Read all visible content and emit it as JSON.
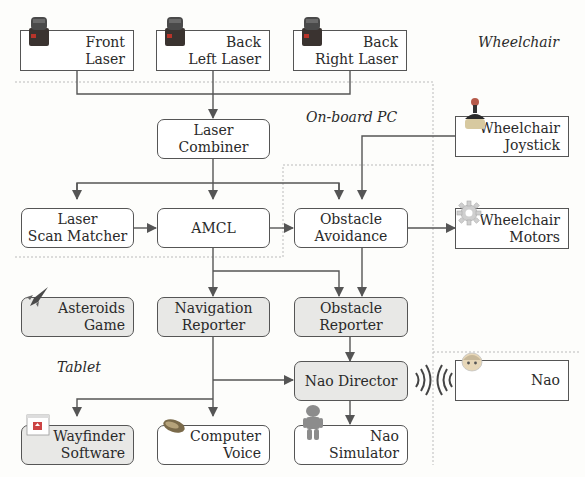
{
  "regions": {
    "wheelchair": "Wheelchair",
    "onboard_pc": "On-board PC",
    "tablet": "Tablet"
  },
  "nodes": {
    "front_laser": {
      "line1": "Front",
      "line2": "Laser"
    },
    "back_left_laser": {
      "line1": "Back",
      "line2": "Left Laser"
    },
    "back_right_laser": {
      "line1": "Back",
      "line2": "Right Laser"
    },
    "laser_combiner": {
      "line1": "Laser",
      "line2": "Combiner"
    },
    "wheelchair_joystick": {
      "line1": "Wheelchair",
      "line2": "Joystick"
    },
    "laser_scan_matcher": {
      "line1": "Laser",
      "line2": "Scan Matcher"
    },
    "amcl": {
      "line1": "AMCL"
    },
    "obstacle_avoidance": {
      "line1": "Obstacle",
      "line2": "Avoidance"
    },
    "wheelchair_motors": {
      "line1": "Wheelchair",
      "line2": "Motors"
    },
    "asteroids_game": {
      "line1": "Asteroids",
      "line2": "Game"
    },
    "navigation_reporter": {
      "line1": "Navigation",
      "line2": "Reporter"
    },
    "obstacle_reporter": {
      "line1": "Obstacle",
      "line2": "Reporter"
    },
    "nao_director": {
      "line1": "Nao Director"
    },
    "nao": {
      "line1": "Nao"
    },
    "wayfinder_software": {
      "line1": "Wayfinder",
      "line2": "Software"
    },
    "computer_voice": {
      "line1": "Computer",
      "line2": "Voice"
    },
    "nao_simulator": {
      "line1": "Nao",
      "line2": "Simulator"
    }
  },
  "edges": [
    [
      "front_laser",
      "laser_combiner"
    ],
    [
      "back_left_laser",
      "laser_combiner"
    ],
    [
      "back_right_laser",
      "laser_combiner"
    ],
    [
      "laser_combiner",
      "laser_scan_matcher"
    ],
    [
      "laser_combiner",
      "amcl"
    ],
    [
      "laser_combiner",
      "obstacle_avoidance"
    ],
    [
      "wheelchair_joystick",
      "obstacle_avoidance"
    ],
    [
      "laser_scan_matcher",
      "amcl"
    ],
    [
      "amcl",
      "obstacle_avoidance"
    ],
    [
      "amcl",
      "navigation_reporter"
    ],
    [
      "amcl",
      "obstacle_reporter"
    ],
    [
      "obstacle_avoidance",
      "wheelchair_motors"
    ],
    [
      "obstacle_avoidance",
      "obstacle_reporter"
    ],
    [
      "obstacle_reporter",
      "nao_director"
    ],
    [
      "navigation_reporter",
      "nao_director"
    ],
    [
      "navigation_reporter",
      "wayfinder_software"
    ],
    [
      "navigation_reporter",
      "computer_voice"
    ],
    [
      "nao_director",
      "nao_simulator"
    ],
    [
      "nao_director",
      "nao"
    ]
  ]
}
